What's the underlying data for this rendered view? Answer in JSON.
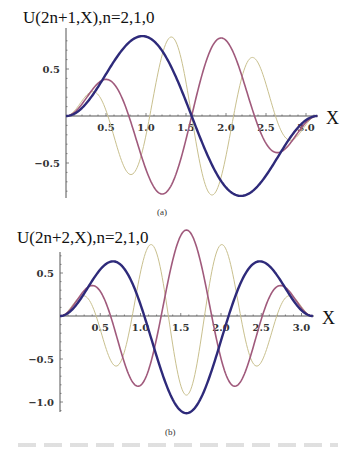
{
  "chart_data": [
    {
      "type": "line",
      "title": "U(2n+1,X),n=2,1,0",
      "panel_label": "(a)",
      "xlabel": "X",
      "ylabel": "",
      "xlim": [
        0,
        3.1416
      ],
      "ylim": [
        -0.87,
        0.87
      ],
      "xticks": [
        "0.5",
        "1.0",
        "1.5",
        "2.0",
        "2.5",
        "3.0"
      ],
      "xtick_values": [
        0.5,
        1.0,
        1.5,
        2.0,
        2.5,
        3.0
      ],
      "yticks": [
        "0.5",
        "-0.5"
      ],
      "ytick_values": [
        0.5,
        -0.5
      ],
      "grid": false,
      "legend": null,
      "series": [
        {
          "name": "n=0",
          "color": "#2e2a7a",
          "width": 2.4,
          "model": "sin(X)*sin(2X)",
          "m": 2,
          "amp": 1.1,
          "x": [
            0,
            0.25,
            0.5,
            0.75,
            0.97,
            1.25,
            1.5708,
            1.9,
            2.2,
            2.5,
            2.8,
            3.1416
          ],
          "y": [
            0,
            0.12,
            0.4,
            0.69,
            0.85,
            0.64,
            0,
            -0.6,
            -0.85,
            -0.58,
            -0.2,
            0
          ]
        },
        {
          "name": "n=1",
          "color": "#a05a7c",
          "width": 1.6,
          "model": "sin(X)*sin(4X)",
          "m": 4,
          "amp": 1.15,
          "x": [
            0,
            0.3,
            0.55,
            0.9,
            1.25,
            1.5708,
            1.9,
            2.25,
            2.6,
            3.1416
          ],
          "y": [
            0,
            0.55,
            0.83,
            0,
            -0.83,
            0,
            0.83,
            0,
            -0.83,
            0
          ]
        },
        {
          "name": "n=2",
          "color": "#c9c08e",
          "width": 1.0,
          "model": "sin(X)*sin(6X)",
          "m": 6,
          "amp": 1.2,
          "x": [
            0,
            0.4,
            0.63,
            0.95,
            1.33,
            1.5708,
            1.8,
            2.25,
            2.75,
            3.1416
          ],
          "y": [
            0,
            0.85,
            0,
            -0.83,
            0.83,
            0,
            -0.83,
            0.83,
            -0.83,
            0
          ]
        }
      ]
    },
    {
      "type": "line",
      "title": "U(2n+2,X),n=2,1,0",
      "panel_label": "(b)",
      "xlabel": "X",
      "ylabel": "",
      "xlim": [
        0,
        3.1416
      ],
      "ylim": [
        -1.15,
        0.75
      ],
      "xticks": [
        "0.5",
        "1.0",
        "1.5",
        "2.0",
        "2.5",
        "3.0"
      ],
      "xtick_values": [
        0.5,
        1.0,
        1.5,
        2.0,
        2.5,
        3.0
      ],
      "yticks": [
        "0.5",
        "-0.5",
        "-1.0"
      ],
      "ytick_values": [
        0.5,
        -0.5,
        -1.0
      ],
      "grid": false,
      "legend": null,
      "series": [
        {
          "name": "n=0",
          "color": "#2e2a7a",
          "width": 2.4,
          "model": "sin(X)*sin(3X)",
          "m": 3,
          "amp": 1.13,
          "x": [
            0,
            0.65,
            1.047,
            1.5708,
            2.094,
            2.49,
            3.1416
          ],
          "y": [
            0,
            0.63,
            0,
            -1.13,
            0,
            0.63,
            0
          ]
        },
        {
          "name": "n=1",
          "color": "#a05a7c",
          "width": 1.6,
          "model": "sin(X)*sin(5X)",
          "m": 5,
          "amp": 1.0,
          "x": [
            0,
            0.43,
            0.75,
            1.05,
            1.35,
            1.5708,
            1.8,
            2.1,
            2.4,
            2.7,
            3.1416
          ],
          "y": [
            0,
            0.7,
            0,
            -0.98,
            0,
            0.65,
            0,
            -0.98,
            0,
            0.7,
            0
          ]
        },
        {
          "name": "n=2",
          "color": "#c9c08e",
          "width": 1.0,
          "model": "sin(X)*sin(7X)",
          "m": 7,
          "amp": 0.92,
          "x": [
            0,
            0.33,
            0.75,
            1.17,
            1.5708,
            1.97,
            2.4,
            2.82,
            3.1416
          ],
          "y": [
            0,
            0.74,
            -0.91,
            0.7,
            -0.91,
            0.7,
            -0.91,
            0.74,
            0
          ]
        }
      ]
    }
  ],
  "captions": {
    "a": "(a)",
    "b": "(b)"
  }
}
